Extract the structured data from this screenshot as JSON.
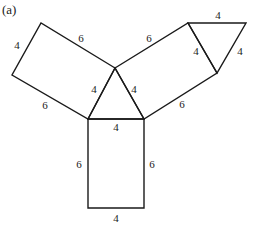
{
  "figure": {
    "label": "(a)",
    "shapes": [
      {
        "name": "central-triangle",
        "type": "equilateral-triangle",
        "side": 4
      },
      {
        "name": "left-rectangle",
        "type": "rectangle",
        "sides": [
          4,
          6
        ]
      },
      {
        "name": "right-rectangle",
        "type": "rectangle",
        "sides": [
          4,
          6
        ]
      },
      {
        "name": "bottom-rectangle",
        "type": "rectangle",
        "sides": [
          4,
          6
        ]
      },
      {
        "name": "top-right-triangle",
        "type": "equilateral-triangle",
        "side": 4
      }
    ],
    "labels": {
      "left_rect_outer_short": "4",
      "left_rect_top_long": "6",
      "left_rect_bottom_long": "6",
      "tri_left": "4",
      "tri_right": "4",
      "tri_bottom": "4",
      "right_rect_top_long": "6",
      "right_rect_bottom_long": "6",
      "right_rect_inner_short": "4",
      "small_tri_top": "4",
      "small_tri_right": "4",
      "bottom_rect_left": "6",
      "bottom_rect_right": "6",
      "bottom_rect_bottom": "4"
    }
  }
}
